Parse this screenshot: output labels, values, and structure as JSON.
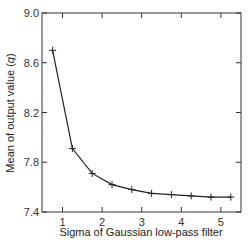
{
  "chart_data": {
    "type": "line",
    "title": "",
    "xlabel": "Sigma of Gaussian low-pass filter",
    "ylabel": "Mean of output value (q)",
    "ylabel_parts": {
      "prefix": "Mean of output value (",
      "italic": "q",
      "suffix": ")"
    },
    "xlim": [
      0.25,
      5.3
    ],
    "ylim": [
      7.4,
      9.0
    ],
    "xticks": [
      1,
      2,
      3,
      4,
      5
    ],
    "yticks": [
      7.4,
      7.8,
      8.2,
      8.6,
      9.0
    ],
    "ytick_labels": [
      "7.4",
      "7.8",
      "8.2",
      "8.6",
      "9.0"
    ],
    "grid": false,
    "legend": null,
    "marker": "+",
    "line_color": "#222222",
    "series": [
      {
        "name": "mean output",
        "x": [
          0.75,
          1.25,
          1.75,
          2.25,
          2.75,
          3.25,
          3.75,
          4.25,
          4.75,
          5.25
        ],
        "y": [
          8.7,
          7.91,
          7.71,
          7.62,
          7.58,
          7.55,
          7.54,
          7.53,
          7.52,
          7.52
        ]
      }
    ]
  }
}
